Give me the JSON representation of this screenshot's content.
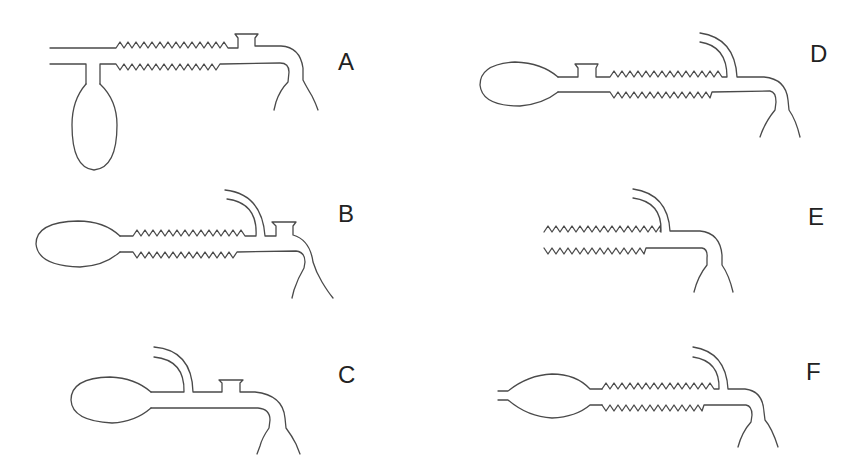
{
  "figure": {
    "colors": {
      "stroke": "#4a4a4a",
      "label": "#222222",
      "background": "#ffffff"
    },
    "panels": [
      {
        "id": "A",
        "label": "A",
        "features": [
          "straight inlet tube",
          "corrugated section",
          "top cup port",
          "hanging bulb below",
          "bent outlet to flask neck"
        ]
      },
      {
        "id": "B",
        "label": "B",
        "features": [
          "left bulb",
          "corrugated section",
          "gooseneck arm",
          "top cup port",
          "bent outlet to flask neck"
        ]
      },
      {
        "id": "C",
        "label": "C",
        "features": [
          "left bulb",
          "gooseneck arm",
          "top cup port",
          "bent outlet to flask neck"
        ]
      },
      {
        "id": "D",
        "label": "D",
        "features": [
          "left bulb",
          "top cup port",
          "corrugated section",
          "gooseneck arm",
          "bent outlet to flask neck"
        ]
      },
      {
        "id": "E",
        "label": "E",
        "features": [
          "open corrugated section",
          "gooseneck arm",
          "bent outlet to flask neck"
        ]
      },
      {
        "id": "F",
        "label": "F",
        "features": [
          "open inlet stub",
          "lens-shaped bulb",
          "corrugated section",
          "gooseneck arm",
          "bent outlet to flask neck"
        ]
      }
    ]
  }
}
